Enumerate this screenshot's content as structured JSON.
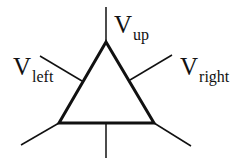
{
  "diagram": {
    "type": "triangle-node-with-spokes",
    "stroke_color": "#111111",
    "triangle": {
      "points": [
        [
          106,
          42
        ],
        [
          59,
          123
        ],
        [
          154,
          123
        ]
      ],
      "stroke_width": 3
    },
    "spokes": [
      {
        "name": "up",
        "x1": 106,
        "y1": 7,
        "x2": 106,
        "y2": 42
      },
      {
        "name": "left",
        "x1": 40,
        "y1": 56,
        "x2": 82,
        "y2": 81
      },
      {
        "name": "right",
        "x1": 172,
        "y1": 55,
        "x2": 130,
        "y2": 80
      },
      {
        "name": "bottom-left",
        "x1": 21,
        "y1": 145,
        "x2": 59,
        "y2": 123
      },
      {
        "name": "bottom-right",
        "x1": 191,
        "y1": 146,
        "x2": 154,
        "y2": 123
      },
      {
        "name": "bottom",
        "x1": 106,
        "y1": 123,
        "x2": 106,
        "y2": 158
      }
    ],
    "labels": {
      "up": {
        "main": "V",
        "sub": "up"
      },
      "left": {
        "main": "V",
        "sub": "left"
      },
      "right": {
        "main": "V",
        "sub": "right"
      }
    }
  }
}
